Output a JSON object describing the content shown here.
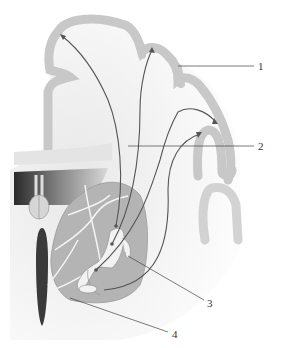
{
  "diagram": {
    "type": "anatomical-cross-section",
    "colors": {
      "background": "#ffffff",
      "white_matter": "#ececec",
      "cortex": "#c8c8c8",
      "nucleus": "#b4b4b4",
      "pathway": "#555555",
      "leader_line": "#444444",
      "ventricle_dark": "#2a2a2a"
    },
    "labels": [
      {
        "id": "1",
        "text": "1",
        "x": 258,
        "y": 66
      },
      {
        "id": "2",
        "text": "2",
        "x": 258,
        "y": 146
      },
      {
        "id": "3",
        "text": "3",
        "x": 207,
        "y": 303
      },
      {
        "id": "4",
        "text": "4",
        "x": 172,
        "y": 334
      }
    ]
  }
}
